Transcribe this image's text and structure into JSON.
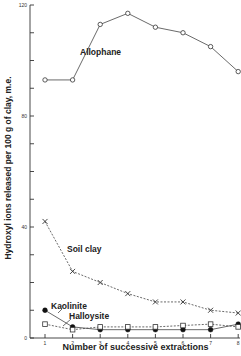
{
  "chart_data": {
    "type": "line",
    "title": "",
    "xlabel": "Number of successive extractions",
    "ylabel": "Hydroxyl ions released per 100 g of clay, m.e.",
    "x": [
      1,
      2,
      3,
      4,
      5,
      6,
      7,
      8
    ],
    "xticks": [
      "1",
      "2",
      "3",
      "4",
      "5",
      "6",
      "7",
      "8"
    ],
    "yticks": [
      "0",
      "40",
      "80",
      "120"
    ],
    "ylim": [
      0,
      120
    ],
    "ytick_minor_step": 10,
    "grid": false,
    "legend": "inline labels",
    "series": [
      {
        "name": "Allophane",
        "marker": "open-circle",
        "line": "solid",
        "values": [
          93,
          93,
          113,
          117,
          112,
          110,
          105,
          96
        ]
      },
      {
        "name": "Soil clay",
        "marker": "x",
        "line": "dashed",
        "values": [
          42,
          24,
          20,
          16,
          13,
          13,
          10,
          9
        ]
      },
      {
        "name": "Kaolinite",
        "marker": "filled-circle",
        "line": "solid",
        "values": [
          10,
          4,
          3,
          3,
          3,
          3,
          3,
          5
        ]
      },
      {
        "name": "Halloysite",
        "marker": "open-square",
        "line": "dashed",
        "values": [
          5,
          3,
          4,
          4,
          4,
          4.5,
          5,
          4
        ]
      }
    ]
  },
  "labels": {
    "xlabel": "Number of successive extractions",
    "ylabel": "Hydroxyl ions released per 100 g of clay, m.e.",
    "allophane": "Allophane",
    "soil_clay": "Soil clay",
    "kaolinite": "Kaolinite",
    "halloysite": "Halloysite"
  }
}
